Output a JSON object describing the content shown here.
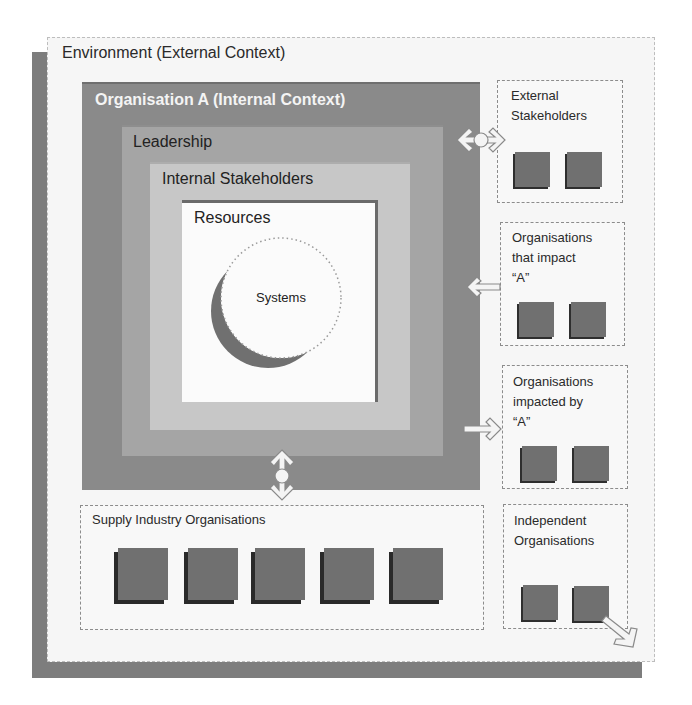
{
  "diagram": {
    "environment": {
      "label": "Environment (External Context)"
    },
    "organisation": {
      "label": "Organisation A  (Internal Context)"
    },
    "leadership": {
      "label": "Leadership"
    },
    "internal_stakeholders": {
      "label": "Internal Stakeholders"
    },
    "resources": {
      "label": "Resources"
    },
    "systems": {
      "label": "Systems"
    },
    "external_groups": [
      {
        "lines": [
          "External",
          "Stakeholders"
        ],
        "squares": 2,
        "relation": "bidirectional"
      },
      {
        "lines": [
          "Organisations",
          "that impact",
          "“A”"
        ],
        "squares": 2,
        "relation": "into-A"
      },
      {
        "lines": [
          "Organisations",
          "impacted by",
          "“A”"
        ],
        "squares": 2,
        "relation": "from-A"
      },
      {
        "lines": [
          "Independent",
          "Organisations"
        ],
        "squares": 2,
        "relation": "outward"
      }
    ],
    "supply": {
      "label": "Supply Industry Organisations",
      "squares": 5,
      "relation": "bidirectional"
    },
    "colors": {
      "environment_bg": "#f6f6f6",
      "environment_shadow": "#7d7d7d",
      "organisation": "#8a8a8a",
      "leadership": "#a5a5a5",
      "internal_stakeholders": "#c7c7c7",
      "resources": "#fbfbfb",
      "entity_square": "#707070"
    }
  }
}
